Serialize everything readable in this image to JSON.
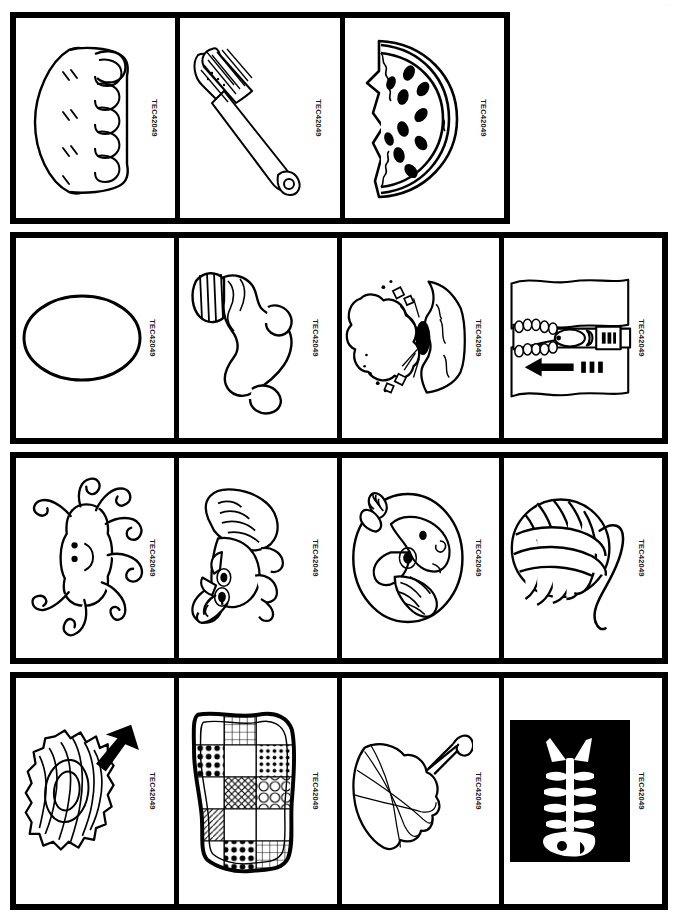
{
  "page": {
    "background_color": "#ffffff",
    "ink_color": "#000000",
    "faint_corner_mark": "· ·"
  },
  "sheet": {
    "title": "Picture card sheet",
    "code_label": "TEC42049",
    "rows": [
      {
        "name": "row-1",
        "cells": [
          {
            "id": "pie",
            "icon": "pie-icon",
            "label": "pie",
            "code": "TEC42049"
          },
          {
            "id": "toothbrush",
            "icon": "toothbrush-icon",
            "label": "toothbrush",
            "code": "TEC42049"
          },
          {
            "id": "watermelon",
            "icon": "watermelon-icon",
            "label": "watermelon",
            "code": "TEC42049"
          }
        ]
      },
      {
        "name": "row-2",
        "cells": [
          {
            "id": "egg",
            "icon": "egg-icon",
            "label": "egg",
            "code": "TEC42049"
          },
          {
            "id": "sock",
            "icon": "sock-icon",
            "label": "sock",
            "code": "TEC42049"
          },
          {
            "id": "volcano",
            "icon": "volcano-icon",
            "label": "volcano",
            "code": "TEC42049"
          },
          {
            "id": "zipper",
            "icon": "zipper-icon",
            "label": "zipper",
            "code": "TEC42049"
          }
        ]
      },
      {
        "name": "row-3",
        "cells": [
          {
            "id": "octopus",
            "icon": "octopus-icon",
            "label": "octopus",
            "code": "TEC42049"
          },
          {
            "id": "raccoon",
            "icon": "raccoon-icon",
            "label": "raccoon",
            "code": "TEC42049"
          },
          {
            "id": "unicorn",
            "icon": "unicorn-icon",
            "label": "unicorn",
            "code": "TEC42049"
          },
          {
            "id": "yarn",
            "icon": "yarn-icon",
            "label": "yarn",
            "code": "TEC42049"
          }
        ]
      },
      {
        "name": "row-4",
        "cells": [
          {
            "id": "nest",
            "icon": "nest-icon",
            "label": "nest",
            "code": "TEC42049"
          },
          {
            "id": "quilt",
            "icon": "quilt-icon",
            "label": "quilt",
            "code": "TEC42049"
          },
          {
            "id": "umbrella",
            "icon": "umbrella-icon",
            "label": "umbrella",
            "code": "TEC42049"
          },
          {
            "id": "xray-fish",
            "icon": "xray-fish-icon",
            "label": "x-ray",
            "code": "TEC42049"
          }
        ]
      }
    ]
  }
}
